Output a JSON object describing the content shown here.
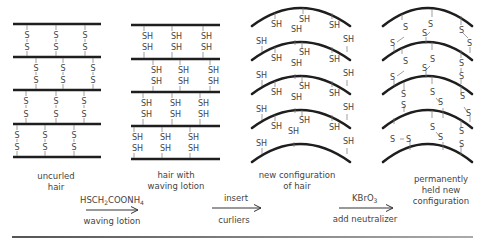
{
  "colors": {
    "strand": "#1e1e1e",
    "bond": "#666666",
    "text": "#444444",
    "separator": "#777777"
  },
  "panels": [
    {
      "id": "uncurled",
      "caption_lines": [
        "uncurled",
        "hair"
      ],
      "atom": "S",
      "bond_type": "disulfide"
    },
    {
      "id": "waving",
      "caption_lines": [
        "hair with",
        "waving lotion"
      ],
      "atom": "SH",
      "bond_type": "broken"
    },
    {
      "id": "curlers",
      "caption_lines": [
        "new configuration",
        "of hair"
      ],
      "atom": "SH",
      "bond_type": "broken-curved"
    },
    {
      "id": "permanent",
      "caption_lines": [
        "permanently",
        "held new",
        "configuration"
      ],
      "atom": "S",
      "bond_type": "disulfide-curved"
    }
  ],
  "steps": [
    {
      "above": "HSCH2COONH4",
      "above_parts": [
        "HSCH",
        "2",
        "COONH",
        "4"
      ],
      "below": "waving lotion"
    },
    {
      "above": "insert",
      "below": "curliers"
    },
    {
      "above": "KBrO3",
      "above_parts": [
        "KBrO",
        "3"
      ],
      "below": "add neutralizer"
    }
  ]
}
